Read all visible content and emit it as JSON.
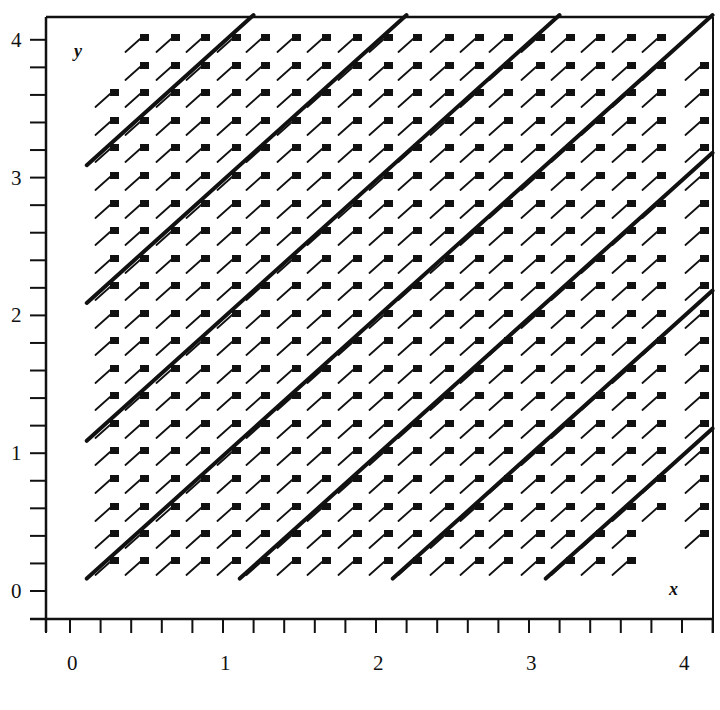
{
  "chart_data": {
    "type": "direction_field",
    "title": "",
    "xlabel": "x",
    "ylabel": "y",
    "xlim": [
      0,
      4
    ],
    "ylim": [
      0,
      4
    ],
    "x_major_ticks": [
      0,
      1,
      2,
      3,
      4
    ],
    "y_major_ticks": [
      0,
      1,
      2,
      3,
      4
    ],
    "x_tick_labels": [
      "0",
      "1",
      "2",
      "3",
      "4"
    ],
    "y_tick_labels": [
      "0",
      "1",
      "2",
      "3",
      "4"
    ],
    "minor_tick_step": 0.2,
    "grid": false,
    "legend": null,
    "slope_field": {
      "equation": "dy/dx = 1",
      "slope": 1,
      "grid_step": 0.2,
      "x_range": [
        0.25,
        4.05
      ],
      "y_range": [
        0.2,
        4.0
      ],
      "marker": "line segment ending in filled square"
    },
    "solution_curves": [
      {
        "name": "y = x + 3",
        "intercept": 3
      },
      {
        "name": "y = x + 2",
        "intercept": 2
      },
      {
        "name": "y = x + 1",
        "intercept": 1
      },
      {
        "name": "y = x",
        "intercept": 0
      },
      {
        "name": "y = x - 1",
        "intercept": -1
      },
      {
        "name": "y = x - 2",
        "intercept": -2
      },
      {
        "name": "y = x - 3",
        "intercept": -3
      }
    ]
  },
  "colors": {
    "ink": "#111111",
    "background": "#ffffff"
  }
}
